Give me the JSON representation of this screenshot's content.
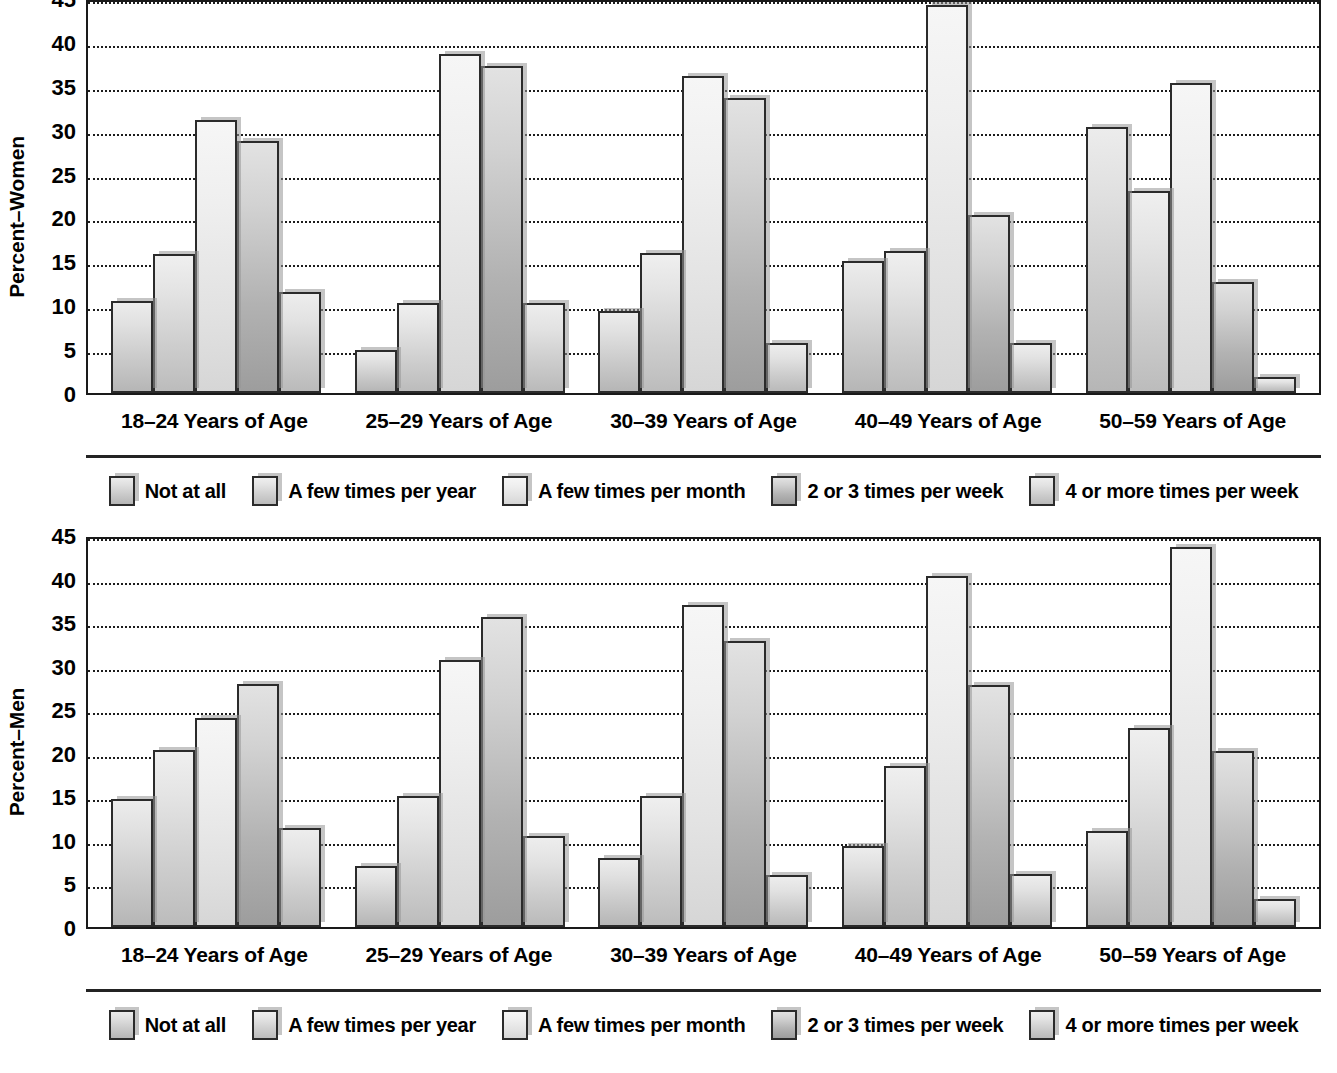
{
  "chart_data": [
    {
      "type": "bar",
      "title": "",
      "ylabel": "Percent–Women",
      "xlabel": "",
      "ylim": [
        0,
        45
      ],
      "yticks": [
        0,
        5,
        10,
        15,
        20,
        25,
        30,
        35,
        40,
        45
      ],
      "grid": true,
      "legend_position": "bottom",
      "categories": [
        "18–24 Years of Age",
        "25–29 Years of Age",
        "30–39 Years of Age",
        "40–49 Years of Age",
        "50–59 Years of Age"
      ],
      "series": [
        {
          "name": "Not at all",
          "values": [
            10.5,
            4.9,
            9.3,
            15.0,
            30.3
          ]
        },
        {
          "name": "A few times per year",
          "values": [
            15.8,
            10.2,
            16.0,
            16.2,
            23.0
          ]
        },
        {
          "name": "A few times per month",
          "values": [
            31.1,
            38.6,
            36.1,
            44.2,
            35.3
          ]
        },
        {
          "name": "2 or 3 times per week",
          "values": [
            28.7,
            37.2,
            33.6,
            20.3,
            12.6
          ]
        },
        {
          "name": "4 or more times per week",
          "values": [
            11.5,
            10.2,
            5.7,
            5.7,
            1.8
          ]
        }
      ]
    },
    {
      "type": "bar",
      "title": "",
      "ylabel": "Percent–Men",
      "xlabel": "",
      "ylim": [
        0,
        45
      ],
      "yticks": [
        0,
        5,
        10,
        15,
        20,
        25,
        30,
        35,
        40,
        45
      ],
      "grid": true,
      "legend_position": "bottom",
      "categories": [
        "18–24 Years of Age",
        "25–29 Years of Age",
        "30–39 Years of Age",
        "40–49 Years of Age",
        "50–59 Years of Age"
      ],
      "series": [
        {
          "name": "Not at all",
          "values": [
            14.7,
            7.0,
            7.9,
            9.3,
            11.0
          ]
        },
        {
          "name": "A few times per year",
          "values": [
            20.3,
            15.0,
            15.0,
            18.5,
            22.8
          ]
        },
        {
          "name": "A few times per month",
          "values": [
            24.0,
            30.6,
            37.0,
            40.3,
            43.6
          ]
        },
        {
          "name": "2 or 3 times per week",
          "values": [
            27.9,
            35.6,
            32.8,
            27.8,
            20.2
          ]
        },
        {
          "name": "4 or more times per week",
          "values": [
            11.4,
            10.5,
            6.0,
            6.1,
            3.2
          ]
        }
      ]
    }
  ],
  "panels": [
    {
      "ylabel": "Percent–Women",
      "yticks": [
        "45",
        "40",
        "35",
        "30",
        "25",
        "20",
        "15",
        "10",
        "5",
        "0"
      ],
      "xlabels": [
        "18–24 Years of Age",
        "25–29 Years of Age",
        "30–39 Years of Age",
        "40–49 Years of Age",
        "50–59 Years of Age"
      ],
      "legend": [
        "Not at all",
        "A few times per year",
        "A few times per month",
        "2 or 3 times per week",
        "4 or more times per week"
      ]
    },
    {
      "ylabel": "Percent–Men",
      "yticks": [
        "45",
        "40",
        "35",
        "30",
        "25",
        "20",
        "15",
        "10",
        "5",
        "0"
      ],
      "xlabels": [
        "18–24 Years of Age",
        "25–29 Years of Age",
        "30–39 Years of Age",
        "40–49 Years of Age",
        "50–59 Years of Age"
      ],
      "legend": [
        "Not at all",
        "A few times per year",
        "A few times per month",
        "2 or 3 times per week",
        "4 or more times per week"
      ]
    }
  ],
  "colors": {
    "axis": "#1a1a1a",
    "grid": "#1d1d1d",
    "text": "#000000",
    "bar_border": "#2b2b2b",
    "bar_shadow": "#969696"
  }
}
